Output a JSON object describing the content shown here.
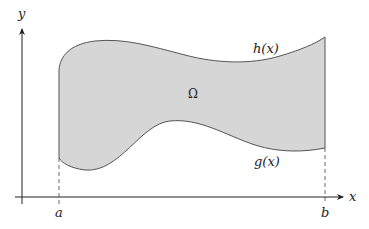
{
  "diagram": {
    "axes": {
      "x_label": "x",
      "y_label": "y"
    },
    "bounds": {
      "left_label": "a",
      "right_label": "b"
    },
    "curves": {
      "upper_label": "h(x)",
      "lower_label": "g(x)"
    },
    "region": {
      "label": "Ω",
      "fill_color": "#d6d6d6",
      "stroke_color": "#555555"
    }
  }
}
